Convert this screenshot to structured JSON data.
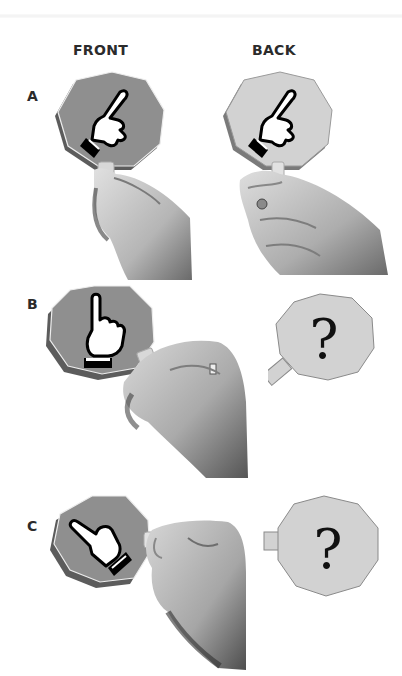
{
  "columns": {
    "front": "FRONT",
    "back": "BACK"
  },
  "rows": [
    {
      "label": "A",
      "front": "pointing-up-diagonal hand on dark card, held by hand",
      "back": "same hand on light card, held by hand"
    },
    {
      "label": "B",
      "front": "index finger pointing up on dark card, held sideways",
      "back": "question mark on light card"
    },
    {
      "label": "C",
      "front": "hand pointing left on dark card, held from right",
      "back": "question mark on light card"
    }
  ],
  "back_symbol": "?",
  "colors": {
    "card_front": "#8f8f8f",
    "card_back": "#d2d2d2",
    "card_edge": "#6e6e6e",
    "skin_light": "#c9c9c9",
    "skin_dark": "#5a5a5a",
    "text": "#2b2b2b"
  }
}
